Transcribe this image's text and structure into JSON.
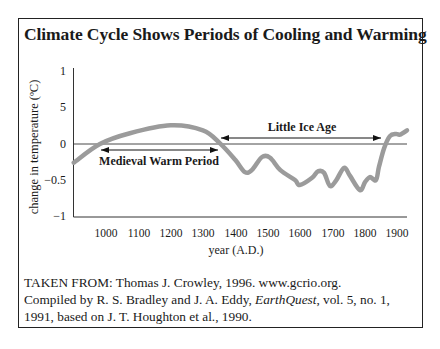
{
  "chart_data": {
    "type": "line",
    "title": "Climate Cycle Shows Periods of Cooling and Warming",
    "xlabel": "year (A.D.)",
    "ylabel": "change in temperature (ºC)",
    "x_ticks": [
      1000,
      1100,
      1200,
      1300,
      1400,
      1500,
      1600,
      1700,
      1800,
      1900
    ],
    "y_ticks": [
      {
        "value": 1,
        "label": "1"
      },
      {
        "value": 0.5,
        "label": "5"
      },
      {
        "value": 0,
        "label": "0"
      },
      {
        "value": -0.5,
        "label": "−0.5"
      },
      {
        "value": -1,
        "label": "−1"
      }
    ],
    "xlim": [
      900,
      1935
    ],
    "ylim": [
      -1,
      1
    ],
    "grid": false,
    "reference_line": {
      "y": 0
    },
    "series": [
      {
        "name": "temperature change",
        "color": "#9b9b9b",
        "x": [
          900,
          981,
          1074,
          1200,
          1300,
          1353,
          1400,
          1430,
          1452,
          1483,
          1508,
          1539,
          1585,
          1600,
          1638,
          1656,
          1675,
          1693,
          1712,
          1737,
          1755,
          1786,
          1802,
          1817,
          1836,
          1845,
          1861,
          1879,
          1898,
          1910,
          1932
        ],
        "y": [
          -0.26,
          0.0,
          0.15,
          0.26,
          0.19,
          0.01,
          -0.22,
          -0.39,
          -0.36,
          -0.18,
          -0.19,
          -0.36,
          -0.5,
          -0.57,
          -0.47,
          -0.38,
          -0.4,
          -0.58,
          -0.51,
          -0.33,
          -0.44,
          -0.64,
          -0.53,
          -0.46,
          -0.5,
          -0.32,
          -0.06,
          0.11,
          0.14,
          0.13,
          0.19
        ]
      }
    ],
    "annotations": [
      {
        "text": "Medieval Warm Period",
        "type": "double-arrow",
        "x_start": 980,
        "x_end": 1350,
        "y": -0.08
      },
      {
        "text": "Little Ice Age",
        "type": "double-arrow",
        "x_start": 1360,
        "x_end": 1850,
        "y": 0.08
      }
    ]
  },
  "header": {
    "title": "Climate Cycle Shows Periods of Cooling and Warming"
  },
  "axes": {
    "ylabel": "change in temperature (ºC)",
    "xlabel": "year (A.D.)",
    "y_tick_labels": [
      "1",
      "5",
      "0",
      "−0.5",
      "−1"
    ],
    "x_tick_labels": [
      "1000",
      "1100",
      "1200",
      "1300",
      "1400",
      "1500",
      "1600",
      "1700",
      "1800",
      "1900"
    ]
  },
  "annotations": {
    "medieval": "Medieval Warm Period",
    "little_ice_age": "Little Ice Age"
  },
  "caption": {
    "line1": "TAKEN FROM: Thomas J. Crowley, 1996. www.gcrio.org.",
    "line2_pre": "Compiled by R. S. Bradley and J. A. Eddy, ",
    "line2_italic": "EarthQuest",
    "line2_post": ", vol. 5, no. 1,",
    "line3": "1991, based on J. T. Houghton et al., 1990."
  },
  "colors": {
    "curve": "#9b9b9b",
    "axis": "#333333",
    "frame": "#222222"
  }
}
